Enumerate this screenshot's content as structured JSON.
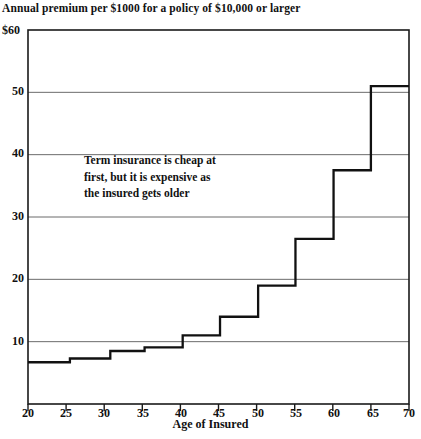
{
  "chart_data": {
    "type": "line",
    "step_style": "post",
    "title": "Annual premium per $1000 for a policy of $10,000 or larger",
    "xlabel": "Age of Insured",
    "ylabel": "",
    "ylabel_top": "$60",
    "xlim": [
      20,
      70
    ],
    "ylim": [
      0,
      60
    ],
    "grid": true,
    "grid_axis": "y",
    "legend": "none",
    "x_ticks": [
      20,
      25,
      30,
      35,
      40,
      45,
      50,
      55,
      60,
      65,
      70
    ],
    "x_tick_labels": [
      "20",
      "25",
      "30",
      "35",
      "40",
      "45",
      "50",
      "55",
      "60",
      "65",
      "70"
    ],
    "y_ticks": [
      10,
      20,
      30,
      40,
      50,
      60
    ],
    "y_tick_labels": [
      "10",
      "20",
      "30",
      "40",
      "50",
      "$60"
    ],
    "series": [
      {
        "name": "Annual premium per $1000",
        "color": "#111111",
        "steps": [
          {
            "x_start": 20,
            "x_end": 25.5,
            "value": 6.7
          },
          {
            "x_start": 25.5,
            "x_end": 30.8,
            "value": 7.3
          },
          {
            "x_start": 30.8,
            "x_end": 35.3,
            "value": 8.5
          },
          {
            "x_start": 35.3,
            "x_end": 40.3,
            "value": 9.1
          },
          {
            "x_start": 40.3,
            "x_end": 45.2,
            "value": 11.0
          },
          {
            "x_start": 45.2,
            "x_end": 50.2,
            "value": 14.0
          },
          {
            "x_start": 50.2,
            "x_end": 55.1,
            "value": 19.0
          },
          {
            "x_start": 55.1,
            "x_end": 60.1,
            "value": 26.5
          },
          {
            "x_start": 60.1,
            "x_end": 65.0,
            "value": 37.5
          },
          {
            "x_start": 65.0,
            "x_end": 70.0,
            "value": 51.0
          }
        ]
      }
    ],
    "annotations": [
      {
        "name": "term-insurance-note",
        "lines": [
          "Term insurance is cheap at",
          "first, but it is expensive as",
          "the insured gets older"
        ],
        "x": 26.5,
        "y": 34
      }
    ],
    "colors": {
      "line": "#111111",
      "axis": "#1a1a1a",
      "grid": "#6b6b6b",
      "background": "#ffffff"
    }
  }
}
